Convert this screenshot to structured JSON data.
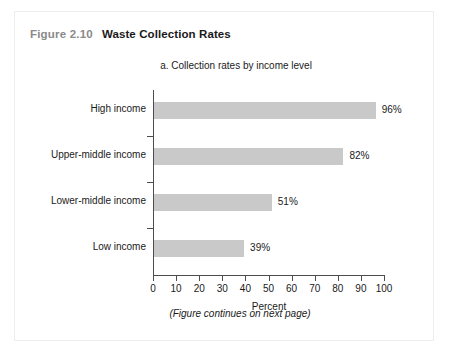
{
  "figure": {
    "number": "Figure 2.10",
    "title": "Waste Collection Rates",
    "continues_note": "(Figure continues on next page)"
  },
  "chart_data": {
    "type": "bar",
    "orientation": "horizontal",
    "title": "a. Collection rates by income level",
    "xlabel": "Percent",
    "ylabel": "",
    "categories": [
      "High income",
      "Upper-middle income",
      "Lower-middle income",
      "Low income"
    ],
    "values": [
      96,
      82,
      51,
      39
    ],
    "value_labels": [
      "96%",
      "82%",
      "51%",
      "39%"
    ],
    "xlim": [
      0,
      100
    ],
    "xticks": [
      0,
      10,
      20,
      30,
      40,
      50,
      60,
      70,
      80,
      90,
      100
    ],
    "xtick_labels": [
      "0",
      "10",
      "20",
      "30",
      "40",
      "50",
      "60",
      "70",
      "80",
      "90",
      "100"
    ],
    "grid": false,
    "legend": null,
    "bar_color": "#c9c9c9",
    "axis_color": "#4d4d4d"
  }
}
